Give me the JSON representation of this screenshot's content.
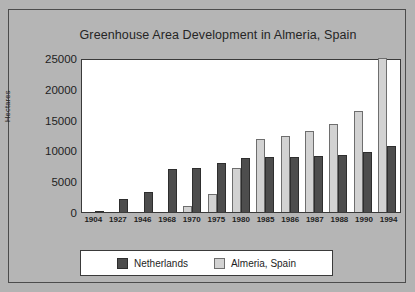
{
  "chart_data": {
    "type": "bar",
    "title": "Greenhouse Area Development in Almeria, Spain",
    "xlabel": "",
    "ylabel": "Hectares",
    "ylim": [
      0,
      25000
    ],
    "ytick_step": 5000,
    "yticks": [
      "0",
      "5000",
      "10000",
      "15000",
      "20000",
      "25000"
    ],
    "grid": false,
    "legend_position": "bottom",
    "categories": [
      "1904",
      "1927",
      "1946",
      "1968",
      "1970",
      "1975",
      "1980",
      "1985",
      "1986",
      "1987",
      "1988",
      "1990",
      "1994"
    ],
    "series": [
      {
        "name": "Netherlands",
        "color": "#4d4d4d",
        "values": [
          100,
          2100,
          3300,
          7000,
          7200,
          7900,
          8700,
          8900,
          9000,
          9100,
          9200,
          9700,
          10700
        ]
      },
      {
        "name": "Almeria, Spain",
        "color": "#d2d2d2",
        "values": [
          0,
          0,
          0,
          0,
          900,
          2900,
          7200,
          11800,
          12300,
          13100,
          14300,
          16400,
          25000
        ]
      }
    ]
  },
  "legend": {
    "entries": [
      {
        "label": "Netherlands",
        "swatch": "dark-swatch"
      },
      {
        "label": "Almeria, Spain",
        "swatch": "light-swatch"
      }
    ]
  }
}
